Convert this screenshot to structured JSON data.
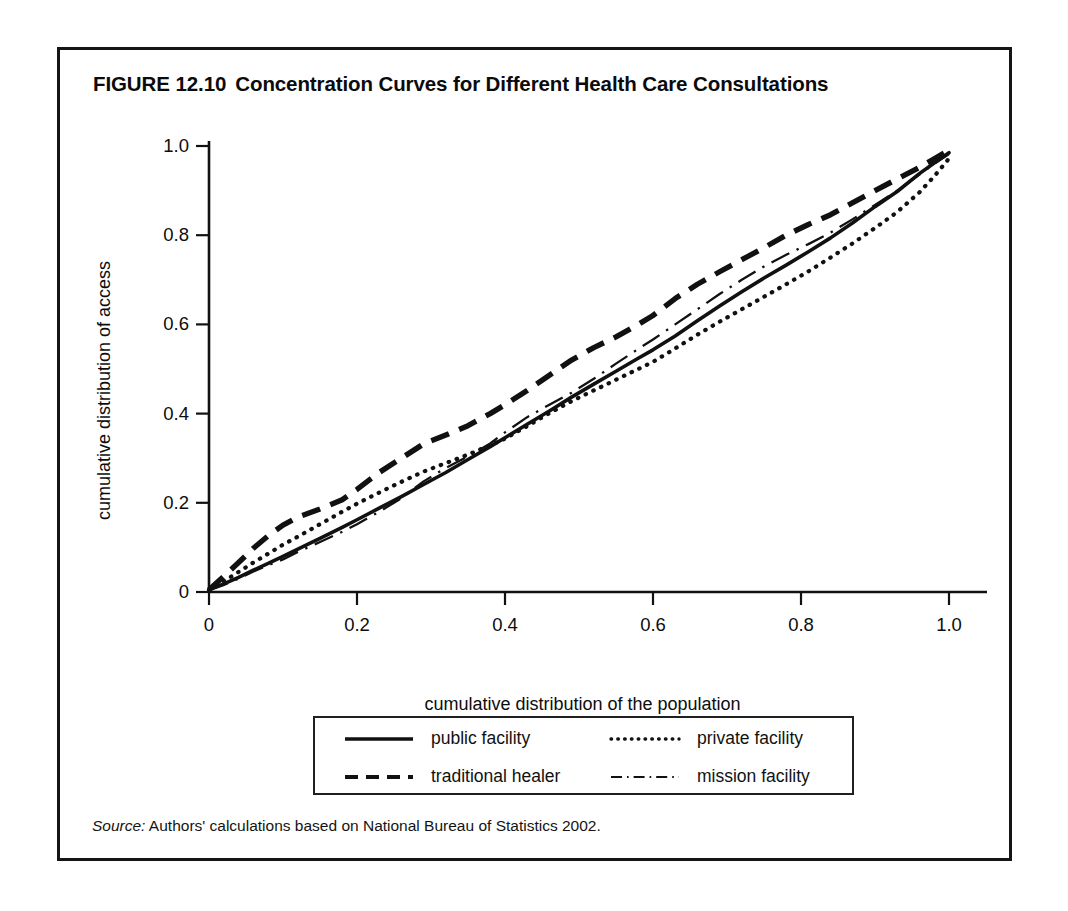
{
  "figure": {
    "number": "FIGURE 12.10",
    "title": "Concentration Curves for Different Health Care Consultations",
    "source_word": "Source:",
    "source_text": " Authors' calculations based on National Bureau of Statistics 2002."
  },
  "legend": {
    "items": [
      {
        "label": "public facility",
        "style": "solid",
        "swatch": "solid-line-swatch"
      },
      {
        "label": "private facility",
        "style": "dotted",
        "swatch": "dotted-line-swatch"
      },
      {
        "label": "traditional healer",
        "style": "dashed",
        "swatch": "dashed-line-swatch"
      },
      {
        "label": "mission facility",
        "style": "dashdot",
        "swatch": "dashdot-line-swatch"
      }
    ]
  },
  "axes": {
    "x_tick_labels": [
      "0",
      "0.2",
      "0.4",
      "0.6",
      "0.8",
      "1.0"
    ],
    "y_tick_labels": [
      "0",
      "0.2",
      "0.4",
      "0.6",
      "0.8",
      "1.0"
    ]
  },
  "chart_data": {
    "type": "line",
    "subtitle": "",
    "xlabel": "cumulative distribution of the population",
    "ylabel": "cumulative distribution of access",
    "xlim": [
      0.0,
      1.0
    ],
    "ylim": [
      0.0,
      1.0
    ],
    "xticks": [
      0.0,
      0.2,
      0.4,
      0.6,
      0.8,
      1.0
    ],
    "yticks": [
      0.0,
      0.2,
      0.4,
      0.6,
      0.8,
      1.0
    ],
    "grid": false,
    "legend_position": "below-axes",
    "annotations": [],
    "line_color": "#111111",
    "series": [
      {
        "name": "public facility",
        "style": "solid",
        "x": [
          0.0,
          0.02,
          0.04,
          0.06,
          0.08,
          0.1,
          0.12,
          0.15,
          0.18,
          0.2,
          0.23,
          0.26,
          0.29,
          0.32,
          0.35,
          0.38,
          0.4,
          0.43,
          0.46,
          0.49,
          0.52,
          0.55,
          0.58,
          0.6,
          0.63,
          0.66,
          0.69,
          0.72,
          0.75,
          0.78,
          0.81,
          0.84,
          0.87,
          0.9,
          0.93,
          0.96,
          0.98,
          1.0
        ],
        "y": [
          0.005,
          0.018,
          0.033,
          0.049,
          0.064,
          0.08,
          0.096,
          0.12,
          0.145,
          0.162,
          0.188,
          0.214,
          0.241,
          0.268,
          0.297,
          0.326,
          0.346,
          0.376,
          0.406,
          0.437,
          0.466,
          0.495,
          0.524,
          0.543,
          0.574,
          0.608,
          0.641,
          0.673,
          0.704,
          0.733,
          0.763,
          0.794,
          0.828,
          0.864,
          0.898,
          0.938,
          0.962,
          0.985
        ]
      },
      {
        "name": "private facility",
        "style": "dotted",
        "x": [
          0.0,
          0.02,
          0.04,
          0.06,
          0.08,
          0.1,
          0.12,
          0.15,
          0.18,
          0.2,
          0.23,
          0.26,
          0.29,
          0.32,
          0.35,
          0.38,
          0.4,
          0.43,
          0.46,
          0.49,
          0.52,
          0.55,
          0.58,
          0.6,
          0.63,
          0.66,
          0.69,
          0.72,
          0.75,
          0.78,
          0.81,
          0.84,
          0.87,
          0.9,
          0.93,
          0.96,
          0.98,
          1.0
        ],
        "y": [
          0.005,
          0.024,
          0.045,
          0.066,
          0.086,
          0.106,
          0.124,
          0.152,
          0.18,
          0.198,
          0.223,
          0.247,
          0.27,
          0.289,
          0.308,
          0.329,
          0.344,
          0.372,
          0.401,
          0.428,
          0.452,
          0.476,
          0.5,
          0.516,
          0.546,
          0.577,
          0.606,
          0.634,
          0.662,
          0.69,
          0.719,
          0.75,
          0.782,
          0.816,
          0.852,
          0.896,
          0.932,
          0.972
        ]
      },
      {
        "name": "traditional healer",
        "style": "dashed",
        "x": [
          0.0,
          0.02,
          0.04,
          0.06,
          0.08,
          0.1,
          0.12,
          0.15,
          0.18,
          0.2,
          0.23,
          0.26,
          0.29,
          0.32,
          0.35,
          0.38,
          0.4,
          0.43,
          0.46,
          0.49,
          0.52,
          0.55,
          0.58,
          0.6,
          0.63,
          0.66,
          0.69,
          0.72,
          0.75,
          0.78,
          0.81,
          0.84,
          0.87,
          0.9,
          0.93,
          0.96,
          0.98,
          1.0
        ],
        "y": [
          0.005,
          0.035,
          0.066,
          0.098,
          0.126,
          0.15,
          0.168,
          0.186,
          0.207,
          0.23,
          0.268,
          0.3,
          0.332,
          0.352,
          0.373,
          0.4,
          0.42,
          0.452,
          0.486,
          0.52,
          0.548,
          0.572,
          0.6,
          0.62,
          0.658,
          0.69,
          0.718,
          0.745,
          0.772,
          0.8,
          0.824,
          0.846,
          0.873,
          0.9,
          0.926,
          0.952,
          0.971,
          0.991
        ]
      },
      {
        "name": "mission facility",
        "style": "dashdot",
        "x": [
          0.0,
          0.02,
          0.04,
          0.06,
          0.08,
          0.1,
          0.12,
          0.15,
          0.18,
          0.2,
          0.23,
          0.26,
          0.29,
          0.32,
          0.35,
          0.38,
          0.4,
          0.43,
          0.46,
          0.49,
          0.52,
          0.55,
          0.58,
          0.6,
          0.63,
          0.66,
          0.69,
          0.72,
          0.75,
          0.78,
          0.81,
          0.84,
          0.87,
          0.9,
          0.93,
          0.96,
          0.98,
          1.0
        ],
        "y": [
          0.005,
          0.016,
          0.03,
          0.046,
          0.06,
          0.073,
          0.09,
          0.112,
          0.135,
          0.152,
          0.18,
          0.21,
          0.248,
          0.278,
          0.304,
          0.333,
          0.358,
          0.392,
          0.42,
          0.447,
          0.478,
          0.512,
          0.545,
          0.566,
          0.6,
          0.634,
          0.668,
          0.7,
          0.73,
          0.756,
          0.78,
          0.806,
          0.836,
          0.868,
          0.9,
          0.936,
          0.96,
          0.982
        ]
      }
    ]
  }
}
